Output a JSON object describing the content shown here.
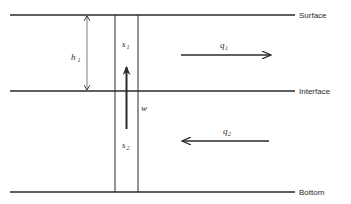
{
  "diagram": {
    "type": "two-layer fluid schematic",
    "colors": {
      "line": "#2a2a2a",
      "background": "#ffffff"
    },
    "boundaries": [
      {
        "id": "surface",
        "label": "Surface"
      },
      {
        "id": "interface",
        "label": "Interface"
      },
      {
        "id": "bottom",
        "label": "Bottom"
      }
    ],
    "layer_thickness": {
      "symbol": "h",
      "subscript": "1"
    },
    "column": {
      "upper_label": {
        "symbol": "s",
        "subscript": "1"
      },
      "lower_label": {
        "symbol": "s",
        "subscript": "2"
      },
      "vertical_flow": {
        "symbol": "w",
        "direction": "up"
      }
    },
    "flows": [
      {
        "symbol": "q",
        "subscript": "1",
        "direction": "right",
        "layer": "upper"
      },
      {
        "symbol": "q",
        "subscript": "2",
        "direction": "left",
        "layer": "lower"
      }
    ]
  }
}
